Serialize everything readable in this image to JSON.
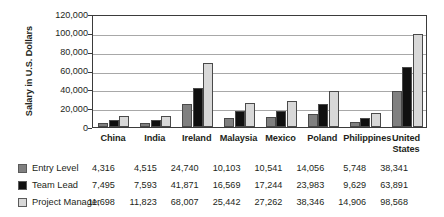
{
  "chart_data": {
    "type": "bar",
    "title": "",
    "xlabel": "",
    "ylabel": "Salary in U.S. Dollars",
    "ylim": [
      0,
      120000
    ],
    "ytick_values": [
      0,
      20000,
      40000,
      60000,
      80000,
      100000,
      120000
    ],
    "ytick_labels": [
      "0",
      "20,000",
      "40,000",
      "60,000",
      "80,000",
      "100,000",
      "120,000"
    ],
    "grid": true,
    "legend_position": "bottom-table",
    "categories": [
      "China",
      "India",
      "Ireland",
      "Malaysia",
      "Mexico",
      "Poland",
      "Philippines",
      "United States"
    ],
    "category_labels": [
      "China",
      "India",
      "Ireland",
      "Malaysia",
      "Mexico",
      "Poland",
      "Philippines",
      "United\nStates"
    ],
    "series": [
      {
        "name": "Entry Level",
        "color": "#808080",
        "values": [
          4316,
          4515,
          24740,
          10103,
          10541,
          14056,
          5748,
          38341
        ],
        "labels": [
          "4,316",
          "4,515",
          "24,740",
          "10,103",
          "10,541",
          "14,056",
          "5,748",
          "38,341"
        ]
      },
      {
        "name": "Team Lead",
        "color": "#101010",
        "values": [
          7495,
          7593,
          41871,
          16569,
          17244,
          23983,
          9629,
          63891
        ],
        "labels": [
          "7,495",
          "7,593",
          "41,871",
          "16,569",
          "17,244",
          "23,983",
          "9,629",
          "63,891"
        ]
      },
      {
        "name": "Project Manager",
        "color": "#d8d8d8",
        "values": [
          11698,
          11823,
          68007,
          25442,
          27262,
          38346,
          14906,
          98568
        ],
        "labels": [
          "11,698",
          "11,823",
          "68,007",
          "25,442",
          "27,262",
          "38,346",
          "14,906",
          "98,568"
        ]
      }
    ]
  }
}
